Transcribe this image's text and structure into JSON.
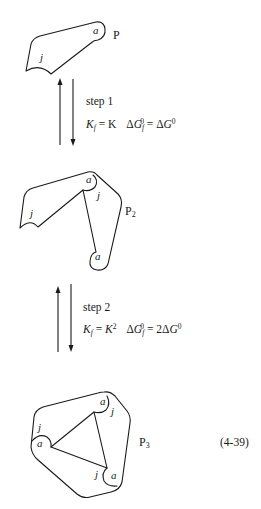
{
  "figure": {
    "equation_number": "(4-39)",
    "structures": [
      {
        "id": "P",
        "name": "P",
        "subscript": "",
        "labels": {
          "acceptor": "a",
          "joint": "j"
        }
      },
      {
        "id": "P2",
        "name": "P",
        "subscript": "2",
        "labels": {
          "acceptor_top": "a",
          "joint_top": "j",
          "joint_left": "j",
          "acceptor_bottom": "a"
        }
      },
      {
        "id": "P3",
        "name": "P",
        "subscript": "3",
        "labels": {
          "acceptor_top": "a",
          "joint_top": "j",
          "joint_left": "j",
          "acceptor_left": "a",
          "joint_right": "j",
          "acceptor_right": "a"
        }
      }
    ],
    "steps": [
      {
        "label": "step 1",
        "kf_symbol": "K",
        "kf_sub": "f",
        "kf_eq": " = ",
        "kf_value": "K",
        "kf_value_sup": "",
        "dg_symbol": "ΔG",
        "dg_sub": "f",
        "dg_sup": "0",
        "dg_eq": " = ",
        "dg_coeff": "",
        "dg_value": "ΔG",
        "dg_value_sup": "0"
      },
      {
        "label": "step 2",
        "kf_symbol": "K",
        "kf_sub": "f",
        "kf_eq": " = ",
        "kf_value": "K",
        "kf_value_sup": "2",
        "dg_symbol": "ΔG",
        "dg_sub": "f",
        "dg_sup": "0",
        "dg_eq": " = ",
        "dg_coeff": "2",
        "dg_value": "ΔG",
        "dg_value_sup": "0"
      }
    ],
    "arrows": [
      {
        "step": 1,
        "direction": "up-and-down",
        "meaning": "reversible equilibrium"
      },
      {
        "step": 2,
        "direction": "up-and-down",
        "meaning": "reversible equilibrium"
      }
    ],
    "colors": {
      "ink": "#1a1a1a",
      "background": "#ffffff"
    }
  }
}
